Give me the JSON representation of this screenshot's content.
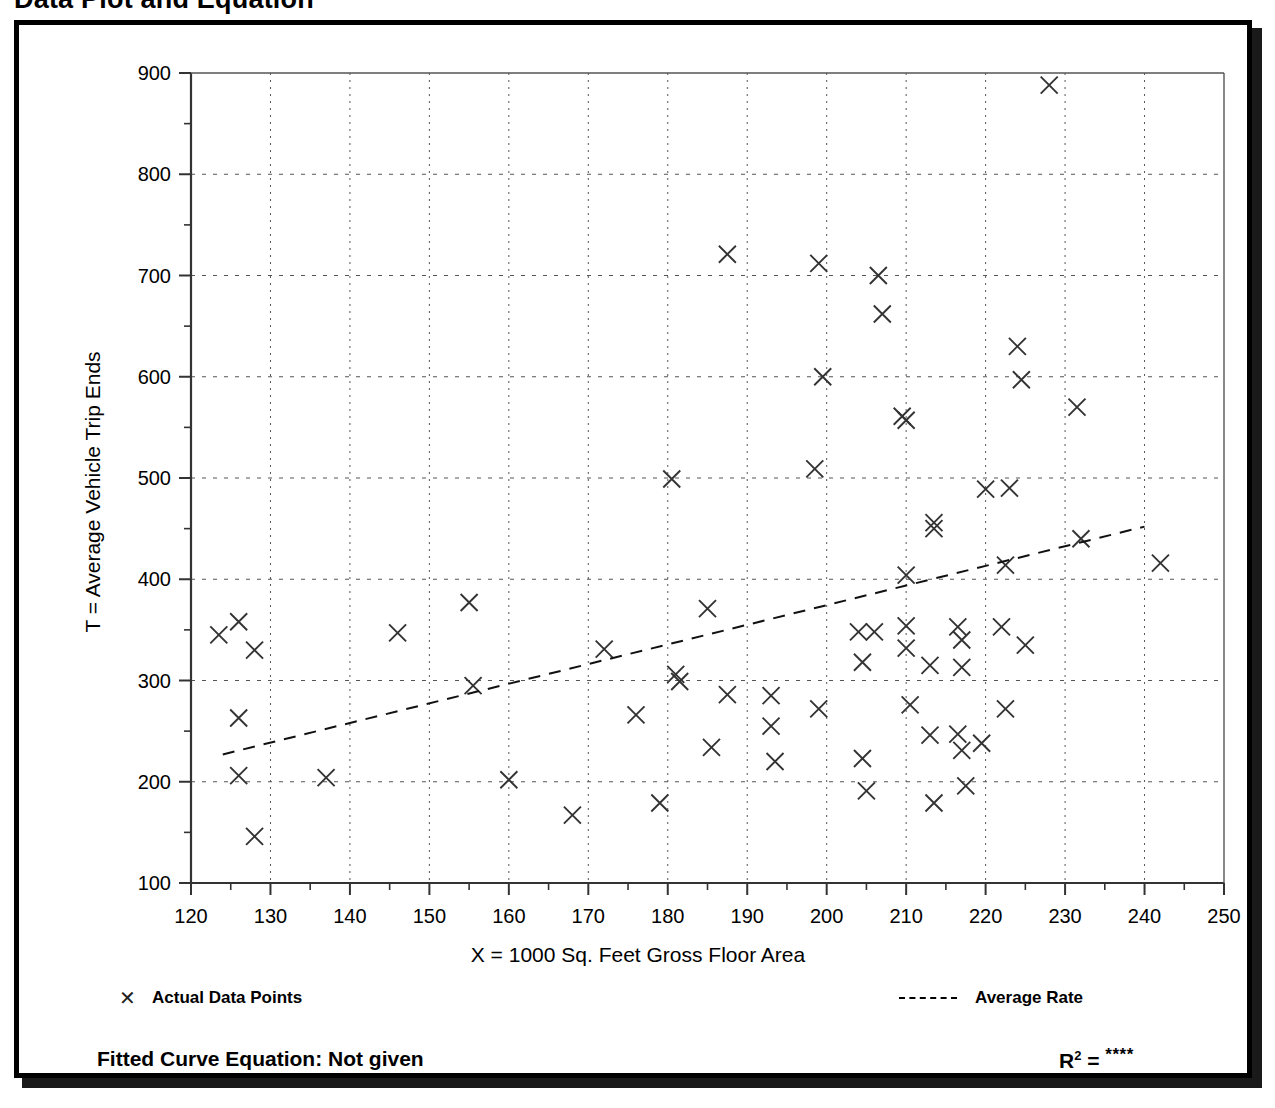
{
  "page": {
    "title": "Data Plot and Equation"
  },
  "legend": {
    "data_points_label": "Actual Data Points",
    "average_rate_label": "Average Rate",
    "marker_icon": "x-marker-icon",
    "line_icon": "dashed-line-icon"
  },
  "footer": {
    "equation_label": "Fitted Curve Equation:  Not given",
    "r2_label": "R",
    "r2_exponent": "2",
    "r2_equals": " = ",
    "r2_value": "****"
  },
  "chart_data": {
    "type": "scatter",
    "title": "Data Plot and Equation",
    "xlabel": "X = 1000 Sq. Feet Gross Floor Area",
    "ylabel": "T = Average Vehicle Trip Ends",
    "xlim": [
      120,
      250
    ],
    "ylim": [
      100,
      900
    ],
    "xticks": [
      120,
      130,
      140,
      150,
      160,
      170,
      180,
      190,
      200,
      210,
      220,
      230,
      240,
      250
    ],
    "yticks": [
      100,
      200,
      300,
      400,
      500,
      600,
      700,
      800,
      900
    ],
    "xtick_labels": [
      "120",
      "130",
      "140",
      "150",
      "160",
      "170",
      "180",
      "190",
      "200",
      "210",
      "220",
      "230",
      "240",
      "250"
    ],
    "ytick_labels": [
      "100",
      "200",
      "300",
      "400",
      "500",
      "600",
      "700",
      "800",
      "900"
    ],
    "x_minor_tick_step": 5,
    "y_minor_tick_step": 50,
    "grid": true,
    "grid_style": "dotted",
    "legend_position": "below-axes",
    "marker": "x",
    "marker_color": "#333333",
    "series": [
      {
        "name": "Actual Data Points",
        "points": [
          [
            123.5,
            345
          ],
          [
            126.0,
            358
          ],
          [
            128.0,
            330
          ],
          [
            126.0,
            263
          ],
          [
            126.0,
            206
          ],
          [
            128.0,
            146
          ],
          [
            137.0,
            204
          ],
          [
            146.0,
            347
          ],
          [
            155.0,
            377
          ],
          [
            155.5,
            295
          ],
          [
            160.0,
            202
          ],
          [
            168.0,
            167
          ],
          [
            172.0,
            331
          ],
          [
            176.0,
            266
          ],
          [
            179.0,
            179
          ],
          [
            180.5,
            499
          ],
          [
            181.0,
            306
          ],
          [
            181.5,
            299
          ],
          [
            185.0,
            371
          ],
          [
            185.5,
            234
          ],
          [
            187.5,
            721
          ],
          [
            187.5,
            286
          ],
          [
            193.0,
            285
          ],
          [
            193.5,
            220
          ],
          [
            193.0,
            255
          ],
          [
            198.5,
            509
          ],
          [
            199.0,
            712
          ],
          [
            199.5,
            600
          ],
          [
            199.0,
            272
          ],
          [
            204.0,
            348
          ],
          [
            204.5,
            318
          ],
          [
            204.5,
            223
          ],
          [
            205.0,
            191
          ],
          [
            206.5,
            700
          ],
          [
            206.0,
            348
          ],
          [
            207.0,
            662
          ],
          [
            209.5,
            561
          ],
          [
            210.0,
            557
          ],
          [
            210.0,
            404
          ],
          [
            210.0,
            354
          ],
          [
            210.0,
            332
          ],
          [
            210.5,
            276
          ],
          [
            213.5,
            456
          ],
          [
            213.5,
            450
          ],
          [
            213.0,
            315
          ],
          [
            213.0,
            246
          ],
          [
            213.5,
            179
          ],
          [
            216.5,
            247
          ],
          [
            216.5,
            353
          ],
          [
            217.0,
            340
          ],
          [
            217.0,
            313
          ],
          [
            217.0,
            231
          ],
          [
            217.5,
            196
          ],
          [
            219.5,
            238
          ],
          [
            220.0,
            489
          ],
          [
            222.0,
            353
          ],
          [
            222.5,
            414
          ],
          [
            222.5,
            272
          ],
          [
            223.0,
            490
          ],
          [
            224.0,
            630
          ],
          [
            224.5,
            597
          ],
          [
            225.0,
            335
          ],
          [
            228.0,
            888
          ],
          [
            231.5,
            570
          ],
          [
            232.0,
            440
          ],
          [
            242.0,
            416
          ]
        ]
      },
      {
        "name": "Average Rate",
        "type": "line",
        "style": "dashed",
        "endpoints": [
          [
            124.0,
            227
          ],
          [
            240.0,
            452
          ]
        ]
      }
    ]
  }
}
